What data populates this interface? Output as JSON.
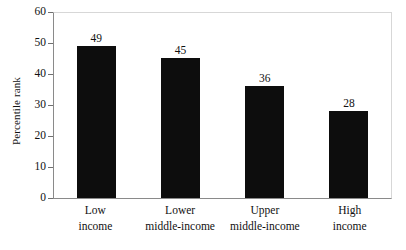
{
  "chart_data": {
    "type": "bar",
    "title": "",
    "xlabel": "",
    "ylabel": "Percentile rank",
    "categories": [
      "Low income",
      "Lower middle-income",
      "Upper middle-income",
      "High income"
    ],
    "category_lines": [
      [
        "Low",
        "income"
      ],
      [
        "Lower",
        "middle-income"
      ],
      [
        "Upper",
        "middle-income"
      ],
      [
        "High",
        "income"
      ]
    ],
    "values": [
      49,
      45,
      36,
      28
    ],
    "value_labels": [
      "49",
      "45",
      "36",
      "28"
    ],
    "ylim": [
      0,
      60
    ],
    "ytick_labels": [
      "60",
      "50",
      "40",
      "30",
      "20",
      "10",
      "0"
    ],
    "yticks": [
      60,
      50,
      40,
      30,
      20,
      10,
      0
    ],
    "grid": false,
    "legend": "none",
    "bar_color": "#0d0d0d",
    "axis_color": "#8a8a8a",
    "frame_color": "#d7d7d7",
    "background": "#ffffff"
  }
}
